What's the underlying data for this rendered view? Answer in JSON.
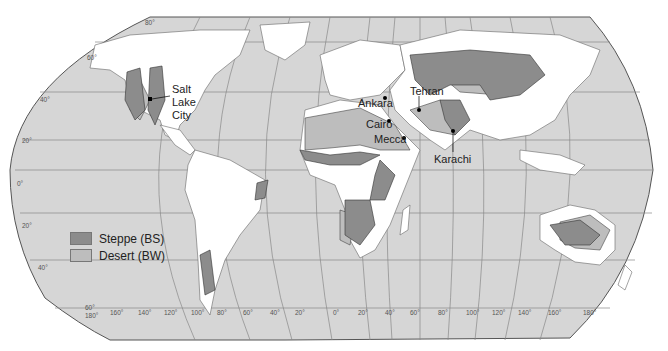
{
  "map": {
    "title": "World distribution of dry climates (Steppe and Desert)",
    "projection": "Robinson",
    "colors": {
      "ocean": "#d6d6d6",
      "land": "#ffffff",
      "steppe": "#8c8c8c",
      "desert": "#bdbdbd",
      "graticule": "#888888",
      "outline": "#555555"
    },
    "latitude_labels": [
      "80°",
      "60°",
      "40°",
      "20°",
      "0°",
      "20°",
      "40°",
      "60°"
    ],
    "longitude_labels": [
      "180°",
      "160°",
      "140°",
      "120°",
      "100°",
      "80°",
      "60°",
      "40°",
      "20°",
      "0°",
      "20°",
      "40°",
      "60°",
      "80°",
      "100°",
      "120°",
      "140°",
      "160°",
      "180°"
    ],
    "cities": [
      {
        "name": "Salt Lake City",
        "lines": [
          "Salt",
          "Lake",
          "City"
        ]
      },
      {
        "name": "Ankara"
      },
      {
        "name": "Tehran"
      },
      {
        "name": "Cairo"
      },
      {
        "name": "Mecca"
      },
      {
        "name": "Karachi"
      }
    ]
  },
  "legend": {
    "items": [
      {
        "label": "Steppe (BS)",
        "color": "#8c8c8c"
      },
      {
        "label": "Desert (BW)",
        "color": "#bdbdbd"
      }
    ]
  }
}
